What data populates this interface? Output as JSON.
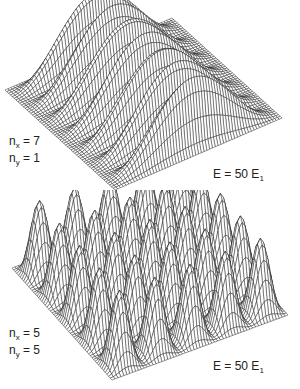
{
  "chart_data": [
    {
      "type": "surface",
      "title": "",
      "description": "Probability density of a particle in a 2D square box",
      "quantum_numbers": {
        "nx": 7,
        "ny": 1
      },
      "function": "sin^2(nx*pi*x) * sin^2(ny*pi*y)",
      "x_range": [
        0,
        1
      ],
      "y_range": [
        0,
        1
      ],
      "grid_lines": 60,
      "peaks_along_x": 7,
      "peaks_along_y": 1,
      "labels": {
        "nx": "7",
        "ny": "1",
        "energy": "E = 50 E",
        "energy_sub": "1"
      },
      "projection": {
        "origin": [
          5,
          90
        ],
        "ex": [
          110,
          100
        ],
        "ey": [
          167,
          -72
        ],
        "z_height": 70
      }
    },
    {
      "type": "surface",
      "title": "",
      "description": "Probability density of a particle in a 2D square box",
      "quantum_numbers": {
        "nx": 5,
        "ny": 5
      },
      "function": "sin^2(nx*pi*x) * sin^2(ny*pi*y)",
      "x_range": [
        0,
        1
      ],
      "y_range": [
        0,
        1
      ],
      "grid_lines": 60,
      "peaks_along_x": 5,
      "peaks_along_y": 5,
      "labels": {
        "nx": "5",
        "ny": "5",
        "energy": "E = 50 E",
        "energy_sub": "1"
      },
      "projection": {
        "origin": [
          12,
          78
        ],
        "ex": [
          100,
          112
        ],
        "ey": [
          176,
          -65
        ],
        "z_height": 72
      }
    }
  ],
  "top": {
    "nx_label": "n",
    "nx_sub": "x",
    "nx_eq": " = 7",
    "ny_label": "n",
    "ny_sub": "y",
    "ny_eq": " = 1",
    "energy_text": "E = 50 E",
    "energy_sub": "1"
  },
  "bottom": {
    "nx_label": "n",
    "nx_sub": "x",
    "nx_eq": " = 5",
    "ny_label": "n",
    "ny_sub": "y",
    "ny_eq": " = 5",
    "energy_text": "E = 50 E",
    "energy_sub": "1"
  },
  "colors": {
    "line": "#1a1a1a",
    "fill": "#ffffff"
  }
}
